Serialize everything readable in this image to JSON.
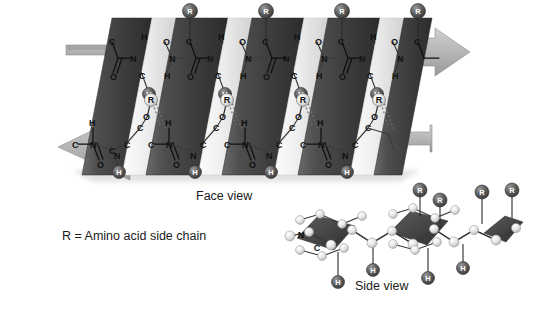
{
  "figure": {
    "background_color": "#ffffff"
  },
  "captions": {
    "face_view": "Face view",
    "side_view": "Side view",
    "legend": "R = Amino acid side chain"
  },
  "colors": {
    "pleat_dark": "#474747",
    "pleat_dark_edge": "#2f2f2f",
    "pleat_light": "#ededed",
    "pleat_light_edge": "#c9c9c9",
    "arrow_fill": "#b3b3b3",
    "arrow_edge": "#8f8f8f",
    "sphere_dark": "#555555",
    "sphere_light": "#e3e3e3",
    "bond_stroke": "#111111",
    "hbond_stroke": "#6e6e6e",
    "text": "#1b1b1b",
    "shadow": "#cccccc"
  },
  "face_view": {
    "strand_count": 2,
    "pleat_panel_count": 9,
    "direction_arrows": [
      {
        "name": "top-strand-arrow",
        "points": "right",
        "label": ""
      },
      {
        "name": "bottom-strand-arrow",
        "points": "left",
        "label": ""
      }
    ],
    "top_strand": {
      "name": "upper-peptide-strand",
      "atom_labels": [
        "C",
        "H",
        "N",
        "O",
        "C",
        "H",
        "N",
        "O",
        "C",
        "H",
        "N",
        "O",
        "C",
        "H",
        "N",
        "O",
        "C",
        "H",
        "N",
        "O",
        "C"
      ],
      "r_group_label": "R",
      "r_group_count": 4,
      "hydrogen_sphere_label": "H",
      "hydrogen_sphere_count": 4
    },
    "bottom_strand": {
      "name": "lower-peptide-strand",
      "atom_labels": [
        "H",
        "C",
        "N",
        "O",
        "H",
        "C",
        "N",
        "O",
        "H",
        "C",
        "N",
        "O",
        "H",
        "C",
        "N",
        "O",
        "H",
        "C",
        "N",
        "O"
      ],
      "r_group_label": "R",
      "r_group_count": 4,
      "hydrogen_sphere_label": "H",
      "hydrogen_sphere_count": 4
    },
    "hydrogen_bonds": {
      "name": "hydrogen-bond-dotted-lines",
      "style": "dotted",
      "count": 8
    }
  },
  "side_view": {
    "name": "side-view-ball-and-stick-model",
    "pleat_planes": 3,
    "atom_labels": [
      "N",
      "C"
    ],
    "r_group_label": "R",
    "r_group_count": 4,
    "hydrogen_label": "H",
    "hydrogen_count": 4
  },
  "atoms": {
    "carbon": "C",
    "nitrogen": "N",
    "oxygen": "O",
    "hydrogen": "H",
    "side_chain": "R"
  }
}
